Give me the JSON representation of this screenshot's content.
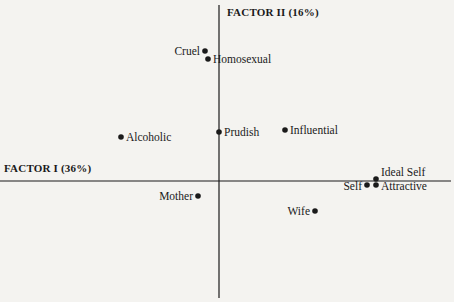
{
  "chart_data": {
    "type": "scatter",
    "title": "",
    "xlabel": "FACTOR I (36%)",
    "ylabel": "FACTOR II (16%)",
    "grid": false,
    "legend": null,
    "axes": {
      "origin_px": [
        219,
        181
      ],
      "x_axis_px": [
        0,
        451
      ],
      "y_axis_px": [
        5,
        298
      ],
      "ticks": "none"
    },
    "points": [
      {
        "label": "Cruel",
        "px": [
          205,
          51
        ],
        "label_side": "left"
      },
      {
        "label": "Homosexual",
        "px": [
          208,
          59
        ],
        "label_side": "right"
      },
      {
        "label": "Alcoholic",
        "px": [
          121,
          137
        ],
        "label_side": "right"
      },
      {
        "label": "Prudish",
        "px": [
          219,
          132
        ],
        "label_side": "right"
      },
      {
        "label": "Influential",
        "px": [
          285,
          130
        ],
        "label_side": "right"
      },
      {
        "label": "Ideal Self",
        "px": [
          376,
          179
        ],
        "label_side": "right"
      },
      {
        "label": "Self",
        "px": [
          367,
          185
        ],
        "label_side": "left"
      },
      {
        "label": "Attractive",
        "px": [
          376,
          185
        ],
        "label_side": "right"
      },
      {
        "label": "Mother",
        "px": [
          198,
          196
        ],
        "label_side": "left"
      },
      {
        "label": "Wife",
        "px": [
          315,
          211
        ],
        "label_side": "left"
      }
    ],
    "relative_coords_note": "x = factor I loading direction, y = factor II; values given as offsets from origin in px",
    "x": [
      -14,
      -11,
      -98,
      0,
      66,
      157,
      148,
      157,
      -21,
      96
    ],
    "y": [
      130,
      122,
      44,
      49,
      51,
      2,
      -4,
      -4,
      -15,
      -30
    ],
    "categories": [
      "Cruel",
      "Homosexual",
      "Alcoholic",
      "Prudish",
      "Influential",
      "Ideal Self",
      "Self",
      "Attractive",
      "Mother",
      "Wife"
    ]
  },
  "labels": {
    "factor1": "FACTOR I (36%)",
    "factor2": "FACTOR II (16%)"
  },
  "colors": {
    "background": "#f4f3f0",
    "ink": "#1a1a1a"
  }
}
